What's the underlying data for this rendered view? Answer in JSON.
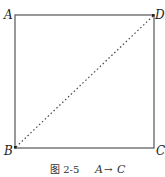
{
  "figure": {
    "square": {
      "x1": 15,
      "y1": 15,
      "x2": 154,
      "y2": 148,
      "stroke": "#444444"
    },
    "diagonal": {
      "from": "B",
      "to": "D",
      "style": "dotted",
      "stroke": "#444444"
    },
    "vertices": [
      {
        "name": "A",
        "x": 4,
        "y": 19
      },
      {
        "name": "D",
        "x": 155,
        "y": 19
      },
      {
        "name": "B",
        "x": 4,
        "y": 155
      },
      {
        "name": "C",
        "x": 156,
        "y": 155
      }
    ],
    "caption": {
      "prefix": "图 2-5",
      "from": "A",
      "arrow": "→",
      "to": "C"
    }
  }
}
